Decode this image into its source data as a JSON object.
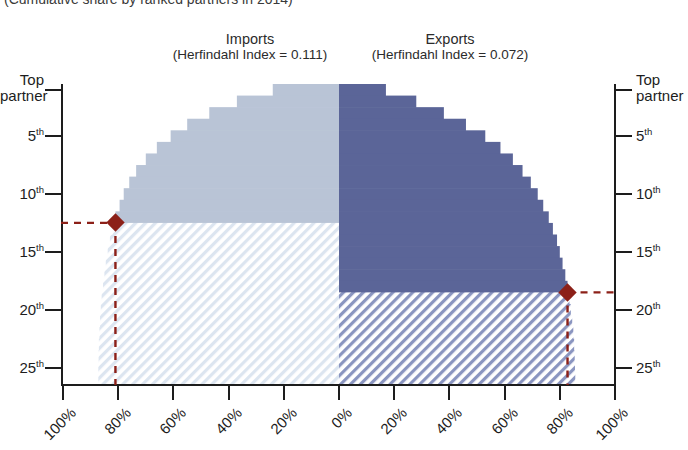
{
  "subtitle": "(Cumulative share by ranked partners in 2014)",
  "panels": {
    "imports": {
      "title": "Imports",
      "index_label": "(Herfindahl Index = 0.111)",
      "herfindahl_index": 0.111,
      "color": "#b9c4d6",
      "hatch_color": "#c9d6e6",
      "marker_rank": 12,
      "marker_share": 80
    },
    "exports": {
      "title": "Exports",
      "index_label": "(Herfindahl Index = 0.072)",
      "herfindahl_index": 0.072,
      "color": "#5b6598",
      "hatch_color": "#7a86b4",
      "marker_rank": 18,
      "marker_share": 80
    }
  },
  "axes": {
    "y_left_labels": [
      "Top partner",
      "5th",
      "10th",
      "15th",
      "20th",
      "25th"
    ],
    "y_right_labels": [
      "Top partner",
      "5th",
      "10th",
      "15th",
      "20th",
      "25th"
    ],
    "y_values": [
      1,
      5,
      10,
      15,
      20,
      25
    ],
    "x_left_labels": [
      "100%",
      "80%",
      "60%",
      "40%",
      "20%",
      "0%"
    ],
    "x_right_labels": [
      "20%",
      "40%",
      "60%",
      "80%",
      "100%"
    ],
    "x_left_values": [
      100,
      80,
      60,
      40,
      20,
      0
    ],
    "x_right_values": [
      20,
      40,
      60,
      80,
      100
    ]
  },
  "marker_color": "#8c2018",
  "chart_data": {
    "type": "area",
    "title": "",
    "subtitle": "(Cumulative share by ranked partners in 2014)",
    "xlabel": "",
    "ylabel": "",
    "orientation": "horizontal-mirrored",
    "grid": false,
    "legend": "none",
    "ylim": [
      1,
      26
    ],
    "xlim_left": [
      0,
      100
    ],
    "xlim_right": [
      0,
      100
    ],
    "categories": [
      1,
      2,
      3,
      4,
      5,
      6,
      7,
      8,
      9,
      10,
      11,
      12,
      13,
      14,
      15,
      16,
      17,
      18,
      19,
      20,
      21,
      22,
      23,
      24,
      25,
      26
    ],
    "series": [
      {
        "name": "Imports",
        "direction": "left",
        "color": "#b9c4d6",
        "values": [
          24,
          37,
          47,
          55,
          61,
          66,
          70,
          73.5,
          76,
          78,
          79.5,
          81,
          82,
          83,
          83.8,
          84.5,
          85,
          85.5,
          86,
          86.3,
          86.6,
          86.8,
          87,
          87.1,
          87.2,
          87.2
        ],
        "marker": {
          "rank": 12,
          "share": 80
        }
      },
      {
        "name": "Exports",
        "direction": "right",
        "color": "#5b6598",
        "values": [
          17,
          28,
          38,
          46,
          53,
          58.5,
          63,
          66.5,
          69.5,
          72,
          74,
          76,
          77.5,
          79,
          80,
          81,
          82,
          82.8,
          83.5,
          84,
          84.5,
          84.9,
          85.2,
          85.4,
          85.5,
          85.6
        ],
        "marker": {
          "rank": 18,
          "share": 80
        }
      }
    ]
  }
}
